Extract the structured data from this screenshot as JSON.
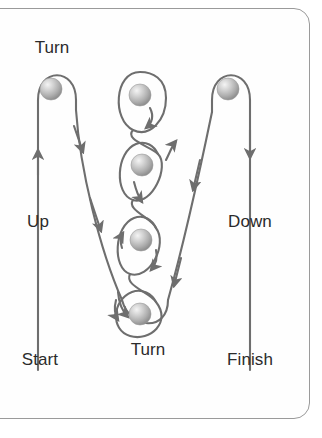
{
  "figure": {
    "type": "flow-diagram",
    "background_color": "#ffffff",
    "panel_border_color": "#9a9a9a",
    "line_color": "#6e6e6e",
    "text_color": "#2b2b2b",
    "ball_color_light": "#f2f2f2",
    "ball_color_mid": "#b8b8b8",
    "ball_color_dark": "#8a8a8a"
  },
  "labels": {
    "turn_top": "Turn",
    "up": "Up",
    "down": "Down",
    "start": "Start",
    "turn_bottom": "Turn",
    "finish": "Finish"
  },
  "balls": [
    {
      "name": "ball-top-left",
      "cx": 51,
      "cy": 89,
      "r": 11
    },
    {
      "name": "ball-middle-1",
      "cx": 140,
      "cy": 95,
      "r": 11
    },
    {
      "name": "ball-top-right",
      "cx": 228,
      "cy": 89,
      "r": 11
    },
    {
      "name": "ball-middle-2",
      "cx": 142,
      "cy": 165,
      "r": 11
    },
    {
      "name": "ball-middle-3",
      "cx": 141,
      "cy": 240,
      "r": 11
    },
    {
      "name": "ball-bottom",
      "cx": 140,
      "cy": 314,
      "r": 11
    }
  ],
  "label_positions": {
    "turn_top": {
      "x": 52,
      "y": 48
    },
    "up": {
      "x": 38,
      "y": 222
    },
    "down": {
      "x": 243,
      "y": 222
    },
    "start": {
      "x": 38,
      "y": 360
    },
    "turn_bottom": {
      "x": 147,
      "y": 360
    },
    "finish": {
      "x": 243,
      "y": 360
    }
  }
}
